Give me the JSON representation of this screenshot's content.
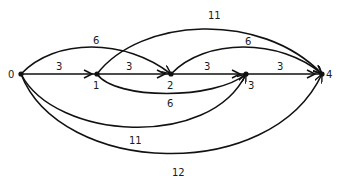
{
  "diagram": {
    "type": "directed-weighted-graph",
    "nodes": [
      {
        "id": "0",
        "label": "0",
        "x": 21,
        "y": 74
      },
      {
        "id": "1",
        "label": "1",
        "x": 97,
        "y": 74
      },
      {
        "id": "2",
        "label": "2",
        "x": 171,
        "y": 74
      },
      {
        "id": "3",
        "label": "3",
        "x": 246,
        "y": 74
      },
      {
        "id": "4",
        "label": "4",
        "x": 322,
        "y": 74
      }
    ],
    "edges": [
      {
        "from": "0",
        "to": "1",
        "weight": "3",
        "shape": "straight"
      },
      {
        "from": "1",
        "to": "2",
        "weight": "3",
        "shape": "straight"
      },
      {
        "from": "2",
        "to": "3",
        "weight": "3",
        "shape": "straight"
      },
      {
        "from": "3",
        "to": "4",
        "weight": "3",
        "shape": "straight"
      },
      {
        "from": "0",
        "to": "2",
        "weight": "6",
        "shape": "upper-arc"
      },
      {
        "from": "1",
        "to": "4",
        "weight": "11",
        "shape": "upper-arc"
      },
      {
        "from": "2",
        "to": "4",
        "weight": "6",
        "shape": "upper-arc"
      },
      {
        "from": "1",
        "to": "3",
        "weight": "6",
        "shape": "lower-arc"
      },
      {
        "from": "0",
        "to": "3",
        "weight": "11",
        "shape": "lower-arc"
      },
      {
        "from": "0",
        "to": "4",
        "weight": "12",
        "shape": "lower-arc"
      }
    ]
  }
}
